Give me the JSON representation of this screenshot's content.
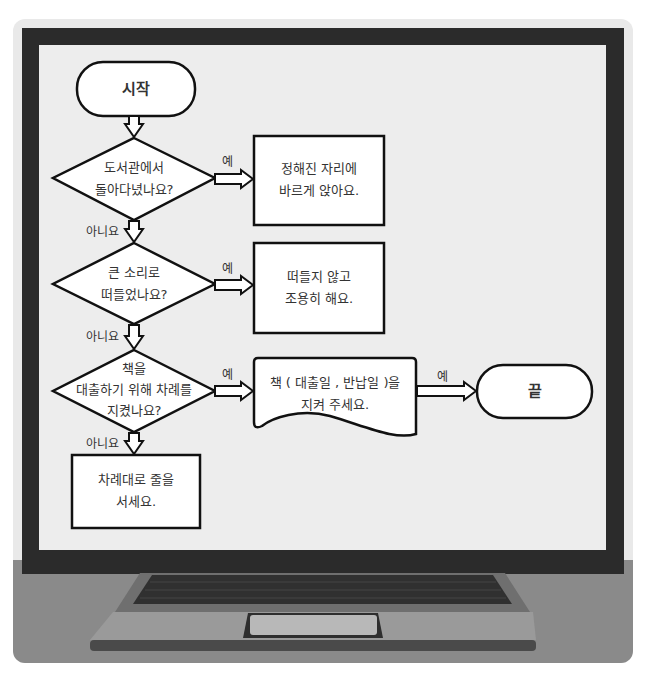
{
  "flowchart": {
    "start": {
      "label": "시작"
    },
    "end": {
      "label": "끝"
    },
    "decisions": [
      {
        "lines": [
          "도서관에서",
          "돌아다녔나요?"
        ],
        "yes_label": "예",
        "no_label": "아니요"
      },
      {
        "lines": [
          "큰 소리로",
          "떠들었나요?"
        ],
        "yes_label": "예",
        "no_label": "아니요"
      },
      {
        "lines": [
          "책을",
          "대출하기 위해 차례를",
          "지켰나요?"
        ],
        "yes_label": "예",
        "no_label": "아니요"
      }
    ],
    "processes": [
      {
        "lines": [
          "정해진 자리에",
          "바르게 앉아요."
        ]
      },
      {
        "lines": [
          "떠들지 않고",
          "조용히 해요."
        ]
      },
      {
        "lines": [
          "차례대로 줄을",
          "서세요."
        ]
      }
    ],
    "document": {
      "lines": [
        "책 ( 대출일 , 반납일 )을",
        "지켜 주세요."
      ],
      "yes_label": "예"
    }
  },
  "colors": {
    "bezel": "#2b2b2b",
    "screen": "#ededed",
    "desk": "#8a8a8a",
    "keyboard": "#3a3a3a",
    "stroke": "#111111"
  }
}
